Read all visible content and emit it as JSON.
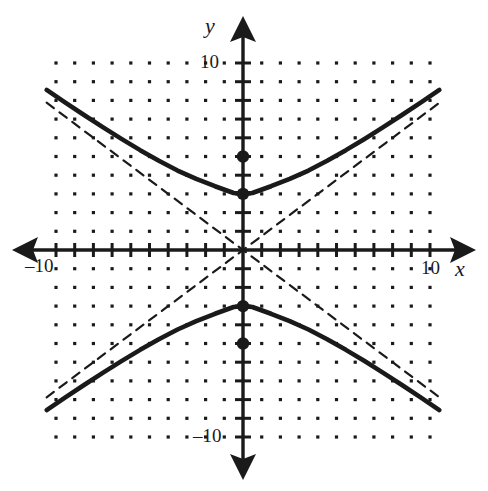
{
  "figure": {
    "title": "",
    "background_color": "#ffffff",
    "ink_color": "#1a1a1a"
  },
  "labels": {
    "y_axis_name": "y",
    "x_axis_name": "x",
    "y_tick_positive": "10",
    "y_tick_negative": "–10",
    "x_tick_positive": "10",
    "x_tick_negative": "–10"
  },
  "chart_data": {
    "type": "line",
    "title": "",
    "xlabel": "x",
    "ylabel": "y",
    "xlim": [
      -10.5,
      10.6
    ],
    "ylim": [
      -10.0,
      10.0
    ],
    "grid": "dot-lattice",
    "grid_spacing": 1,
    "legend": "none",
    "axis_ticks": {
      "x_major_labeled": [
        -10,
        10
      ],
      "y_major_labeled": [
        -10,
        10
      ],
      "tick_interval": 1
    },
    "conic": {
      "kind": "hyperbola",
      "orientation": "vertical",
      "center": [
        0,
        0
      ],
      "a": 3,
      "b": 4,
      "c": 5,
      "equation": "y^2/9 - x^2/16 = 1",
      "vertices": [
        [
          0,
          3
        ],
        [
          0,
          -3
        ]
      ],
      "foci": [
        [
          0,
          5
        ],
        [
          0,
          -5
        ]
      ],
      "asymptote_slopes": [
        0.75,
        -0.75
      ]
    },
    "series": [
      {
        "name": "upper-branch",
        "style": "solid",
        "x": [
          -10.5,
          -9.5,
          -8.5,
          -7.5,
          -6.5,
          -5.5,
          -4.5,
          -3.5,
          -2.5,
          -1.5,
          -0.5,
          0,
          0.5,
          1.5,
          2.5,
          3.5,
          4.5,
          5.5,
          6.5,
          7.5,
          8.5,
          9.5,
          10.5
        ],
        "y": [
          8.56,
          7.88,
          7.22,
          6.57,
          5.94,
          5.34,
          4.77,
          4.25,
          3.8,
          3.41,
          3.05,
          3.0,
          3.05,
          3.41,
          3.8,
          4.25,
          4.77,
          5.34,
          5.94,
          6.57,
          7.22,
          7.88,
          8.56
        ]
      },
      {
        "name": "lower-branch",
        "style": "solid",
        "x": [
          -10.5,
          -9.5,
          -8.5,
          -7.5,
          -6.5,
          -5.5,
          -4.5,
          -3.5,
          -2.5,
          -1.5,
          -0.5,
          0,
          0.5,
          1.5,
          2.5,
          3.5,
          4.5,
          5.5,
          6.5,
          7.5,
          8.5,
          9.5,
          10.5
        ],
        "y": [
          -8.56,
          -7.88,
          -7.22,
          -6.57,
          -5.94,
          -5.34,
          -4.77,
          -4.25,
          -3.8,
          -3.41,
          -3.05,
          -3.0,
          -3.05,
          -3.41,
          -3.8,
          -4.25,
          -4.77,
          -5.34,
          -5.94,
          -6.57,
          -7.22,
          -7.88,
          -8.56
        ]
      },
      {
        "name": "asymptote-positive-slope",
        "style": "dashed",
        "x": [
          -10.5,
          10.5
        ],
        "y": [
          -7.875,
          7.875
        ]
      },
      {
        "name": "asymptote-negative-slope",
        "style": "dashed",
        "x": [
          -10.5,
          10.5
        ],
        "y": [
          7.875,
          -7.875
        ]
      }
    ],
    "points": [
      {
        "name": "focus-upper",
        "x": 0,
        "y": 5,
        "marker": "filled-circle"
      },
      {
        "name": "vertex-upper",
        "x": 0,
        "y": 3,
        "marker": "filled-circle"
      },
      {
        "name": "vertex-lower",
        "x": 0,
        "y": -3,
        "marker": "filled-circle"
      },
      {
        "name": "focus-lower",
        "x": 0,
        "y": -5,
        "marker": "filled-circle"
      }
    ]
  }
}
